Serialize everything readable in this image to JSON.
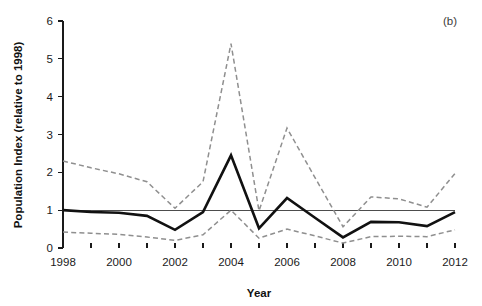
{
  "figure": {
    "panel_label": "(b)",
    "background_color": "#ffffff"
  },
  "colors": {
    "main_series": "#111111",
    "ci_series": "#8f8f8f",
    "axis": "#1a1a1a",
    "baseline": "#4d4d4d"
  },
  "axes": {
    "x_title": "Year",
    "y_title": "Population Index (relative to 1998)",
    "x_tick_labels": [
      "1998",
      "2000",
      "2002",
      "2004",
      "2006",
      "2008",
      "2010",
      "2012"
    ],
    "y_tick_labels": [
      "0",
      "1",
      "2",
      "3",
      "4",
      "5",
      "6"
    ]
  },
  "chart_data": {
    "type": "line",
    "title": "",
    "subtitle": "",
    "xlabel": "Year",
    "ylabel": "Population Index (relative to 1998)",
    "xlim": [
      1998,
      2012
    ],
    "ylim": [
      0,
      6
    ],
    "x_tick_step": 2,
    "y_tick_step": 1,
    "minor_x_ticks_every": 1,
    "grid": false,
    "legend": null,
    "annotations": [
      {
        "text": "(b)",
        "position": "top-right"
      }
    ],
    "reference_line": {
      "y": 1.0,
      "style": "solid",
      "color": "#4d4d4d"
    },
    "x": [
      1998,
      1999,
      2000,
      2001,
      2002,
      2003,
      2004,
      2005,
      2006,
      2007,
      2008,
      2009,
      2010,
      2011,
      2012
    ],
    "series": [
      {
        "name": "Population index",
        "style": "solid",
        "color": "#111111",
        "values": [
          1.0,
          0.95,
          0.93,
          0.85,
          0.48,
          0.95,
          2.45,
          0.52,
          1.32,
          0.8,
          0.28,
          0.69,
          0.68,
          0.58,
          0.95
        ]
      },
      {
        "name": "Upper confidence limit",
        "style": "dashed",
        "color": "#8f8f8f",
        "values": [
          2.3,
          2.12,
          1.96,
          1.75,
          1.05,
          1.75,
          5.4,
          0.98,
          3.17,
          1.86,
          0.56,
          1.35,
          1.3,
          1.08,
          1.97
        ]
      },
      {
        "name": "Lower confidence limit",
        "style": "dashed",
        "color": "#8f8f8f",
        "values": [
          0.42,
          0.39,
          0.36,
          0.29,
          0.2,
          0.35,
          1.0,
          0.26,
          0.5,
          0.32,
          0.13,
          0.3,
          0.31,
          0.3,
          0.48
        ]
      }
    ]
  }
}
